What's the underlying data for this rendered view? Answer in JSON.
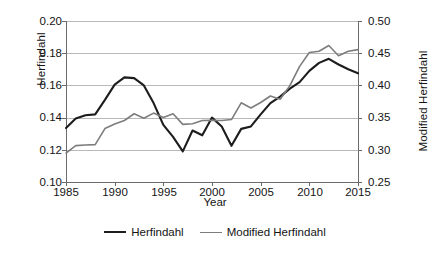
{
  "chart_data": {
    "type": "line",
    "title": "",
    "xlabel": "Year",
    "ylabel": "Herfindahl",
    "y2label": "Modified Herfindahl",
    "grid": true,
    "legend_position": "bottom-center",
    "xlim": [
      1985,
      2015
    ],
    "ylim": [
      0.1,
      0.2
    ],
    "y2lim": [
      0.25,
      0.5
    ],
    "xticks": [
      "1985",
      "1990",
      "1995",
      "2000",
      "2005",
      "2010",
      "2015"
    ],
    "yticks": [
      "0.10",
      "0.12",
      "0.14",
      "0.16",
      "0.18",
      "0.20"
    ],
    "y2ticks": [
      "0.25",
      "0.30",
      "0.35",
      "0.40",
      "0.45",
      "0.50"
    ],
    "x": [
      1985,
      1986,
      1987,
      1988,
      1989,
      1990,
      1991,
      1992,
      1993,
      1994,
      1995,
      1996,
      1997,
      1998,
      1999,
      2000,
      2001,
      2002,
      2003,
      2004,
      2005,
      2006,
      2007,
      2008,
      2009,
      2010,
      2011,
      2012,
      2013,
      2014,
      2015
    ],
    "series": [
      {
        "name": "Herfindahl",
        "axis": "left",
        "color": "#1d1d1d",
        "values": [
          0.1335,
          0.1395,
          0.1415,
          0.142,
          0.151,
          0.1605,
          0.165,
          0.1645,
          0.16,
          0.149,
          0.1355,
          0.128,
          0.119,
          0.132,
          0.129,
          0.14,
          0.1345,
          0.1225,
          0.133,
          0.1345,
          0.142,
          0.149,
          0.153,
          0.158,
          0.162,
          0.169,
          0.174,
          0.1765,
          0.173,
          0.17,
          0.1675
        ]
      },
      {
        "name": "Modified Herfindahl",
        "axis": "right",
        "color": "#7d7d7d",
        "values": [
          0.295,
          0.3065,
          0.3075,
          0.308,
          0.333,
          0.34,
          0.3455,
          0.356,
          0.349,
          0.357,
          0.35,
          0.356,
          0.3395,
          0.3405,
          0.3455,
          0.346,
          0.3455,
          0.347,
          0.373,
          0.365,
          0.3735,
          0.3835,
          0.3785,
          0.3995,
          0.4295,
          0.451,
          0.453,
          0.462,
          0.446,
          0.453,
          0.4555
        ]
      }
    ]
  }
}
